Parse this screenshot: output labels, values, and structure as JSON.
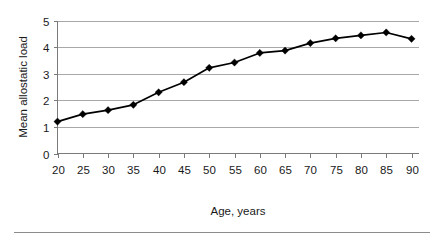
{
  "chart_data": {
    "type": "line",
    "title": "",
    "xlabel": "Age, years",
    "ylabel": "Mean allostatic load",
    "x": [
      20,
      25,
      30,
      35,
      40,
      45,
      50,
      55,
      60,
      65,
      70,
      75,
      80,
      85,
      90
    ],
    "values": [
      1.2,
      1.48,
      1.63,
      1.83,
      2.3,
      2.68,
      3.22,
      3.42,
      3.78,
      3.87,
      4.15,
      4.33,
      4.44,
      4.55,
      4.31
    ],
    "categories": [
      "20",
      "25",
      "30",
      "35",
      "40",
      "45",
      "50",
      "55",
      "60",
      "65",
      "70",
      "75",
      "80",
      "85",
      "90"
    ],
    "series": [
      {
        "name": "Mean allostatic load",
        "values": [
          1.2,
          1.48,
          1.63,
          1.83,
          2.3,
          2.68,
          3.22,
          3.42,
          3.78,
          3.87,
          4.15,
          4.33,
          4.44,
          4.55,
          4.31
        ]
      }
    ],
    "xlim": [
      20,
      90
    ],
    "ylim": [
      0,
      5
    ],
    "ytick_labels": [
      "0",
      "1",
      "2",
      "3",
      "4",
      "5"
    ],
    "ytick_values": [
      0,
      1,
      2,
      3,
      4,
      5
    ],
    "xtick_labels": [
      "20",
      "25",
      "30",
      "35",
      "40",
      "45",
      "50",
      "55",
      "60",
      "65",
      "70",
      "75",
      "80",
      "85",
      "90"
    ],
    "grid": "horizontal",
    "legend": "none",
    "marker": "diamond",
    "line_color": "#000000",
    "marker_color": "#000000",
    "grid_color": "#a8a8a8",
    "axis_color": "#7a7a7a",
    "background": "#ffffff"
  }
}
